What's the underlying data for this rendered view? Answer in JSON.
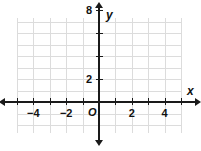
{
  "chart_data": {
    "type": "scatter",
    "title": "",
    "xlabel": "x",
    "ylabel": "y",
    "origin_label": "O",
    "grid": true,
    "legend": null,
    "series": [],
    "x": [],
    "values": [],
    "xlim": [
      -5,
      5
    ],
    "ylim": [
      -2,
      10
    ],
    "x_tick_values": [
      -5,
      -4,
      -3,
      -2,
      -1,
      1,
      2,
      3,
      4,
      5
    ],
    "y_tick_values": [
      2,
      4,
      6,
      8
    ],
    "x_axis_labels": [
      {
        "value": -4,
        "text": "−4"
      },
      {
        "value": -2,
        "text": "−2"
      },
      {
        "value": 2,
        "text": "2"
      },
      {
        "value": 4,
        "text": "4"
      }
    ],
    "y_axis_labels": [
      {
        "value": 2,
        "text": "2"
      },
      {
        "value": 8,
        "text": "8"
      }
    ],
    "x_grid_lines": [
      -5,
      -4,
      -3,
      -2,
      -1,
      0,
      1,
      2,
      3,
      4,
      5
    ],
    "y_grid_lines": [
      -2,
      -1,
      0,
      1,
      2,
      3,
      4,
      5,
      6,
      7,
      8,
      9,
      10
    ],
    "colors": {
      "grid": "#dcdcdc",
      "axis": "#1a1a1a",
      "label": "#111111",
      "background": "#ffffff"
    }
  },
  "geometry": {
    "width": 201,
    "height": 151,
    "origin_px": {
      "x": 99,
      "y": 102
    },
    "unit_px": {
      "x": 16.4,
      "y": 11.5
    },
    "grid_rect": {
      "left": 18,
      "top": 18,
      "right": 182,
      "bottom": 133
    },
    "x_axis_span": {
      "from": 5,
      "to": 195
    },
    "y_axis_span": {
      "from": 8,
      "to": 140
    }
  },
  "axis_names": {
    "x": "x",
    "y": "y",
    "origin": "O"
  }
}
